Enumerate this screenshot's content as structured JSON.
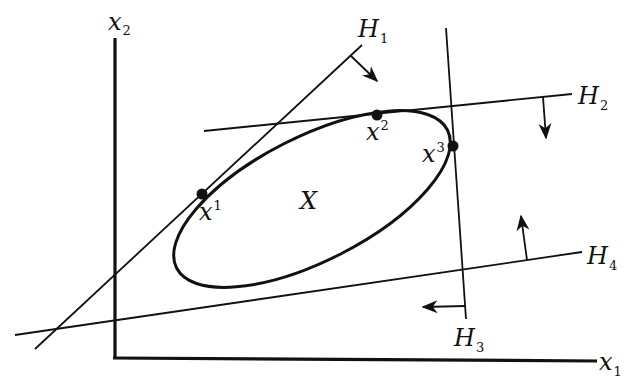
{
  "figure": {
    "colors": {
      "ink": "#111111",
      "background": "#ffffff"
    },
    "axes": {
      "x_label": {
        "base": "x",
        "sub": "1"
      },
      "y_label": {
        "base": "x",
        "sub": "2"
      }
    },
    "set_label": "X",
    "points": [
      {
        "id": "x1",
        "base": "x",
        "sup": "1",
        "cx": 202,
        "cy": 194
      },
      {
        "id": "x2",
        "base": "x",
        "sup": "2",
        "cx": 377,
        "cy": 114
      },
      {
        "id": "x3",
        "base": "x",
        "sup": "3",
        "cx": 453,
        "cy": 146
      }
    ],
    "hyperplanes": [
      {
        "id": "H1",
        "base": "H",
        "sub": "1",
        "arrow_direction": "down-right"
      },
      {
        "id": "H2",
        "base": "H",
        "sub": "2",
        "arrow_direction": "down"
      },
      {
        "id": "H3",
        "base": "H",
        "sub": "3",
        "arrow_direction": "left"
      },
      {
        "id": "H4",
        "base": "H",
        "sub": "4",
        "arrow_direction": "up"
      }
    ]
  }
}
